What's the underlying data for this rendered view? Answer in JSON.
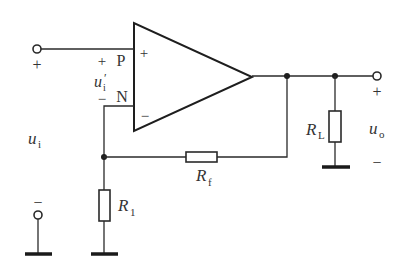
{
  "diagram": {
    "type": "circuit-schematic",
    "opamp": {
      "plus_pin_sign": "+",
      "minus_pin_sign": "−"
    },
    "nodes": {
      "p_label": "P",
      "n_label": "N"
    },
    "input": {
      "top_sign": "+",
      "bottom_sign": "−",
      "voltage_symbol": "u",
      "voltage_subscript": "i"
    },
    "differential_input": {
      "plus_sign": "+",
      "minus_sign": "−",
      "voltage_symbol": "u",
      "voltage_subscript": "i",
      "prime": "′"
    },
    "output": {
      "top_sign": "+",
      "bottom_sign": "−",
      "voltage_symbol": "u",
      "voltage_subscript": "o"
    },
    "resistors": [
      {
        "id": "r1",
        "symbol": "R",
        "subscript": "1"
      },
      {
        "id": "rf",
        "symbol": "R",
        "subscript": "f"
      },
      {
        "id": "rl",
        "symbol": "R",
        "subscript": "L"
      }
    ],
    "colors": {
      "line": "#2a2a2a",
      "background": "#ffffff",
      "text": "#333333"
    }
  }
}
